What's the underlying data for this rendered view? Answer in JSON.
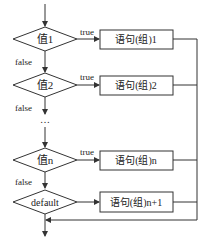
{
  "diagram": {
    "colors": {
      "stroke": "#333333",
      "text": "#222222",
      "background": "#ffffff"
    },
    "conditions": [
      {
        "label": "值1",
        "true_label": "true",
        "false_label": "false",
        "statement": "语句(组)1"
      },
      {
        "label": "值2",
        "true_label": "true",
        "false_label": "false",
        "statement": "语句(组)2"
      },
      {
        "label": "值n",
        "true_label": "true",
        "false_label": "false",
        "statement": "语句(组)n"
      }
    ],
    "ellipsis": "…",
    "default": {
      "label": "default",
      "statement": "语句(组)n+1"
    }
  }
}
